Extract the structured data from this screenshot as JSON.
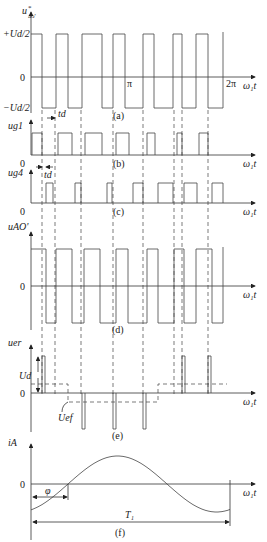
{
  "diagram": {
    "axis_x": 31,
    "axis_end_x": 255,
    "x_axis_label": "ω₁t",
    "dashed_lines_x": [
      42,
      55,
      81,
      113,
      143,
      174,
      182,
      208
    ],
    "panels": [
      {
        "id": "a",
        "caption": "(a)",
        "y_label": "u*ₐₒ'",
        "y_ticks": [
          "+Ud/2",
          "0",
          "−Ud/2"
        ],
        "x_ticks": [
          "π",
          "2π"
        ],
        "zero_y": 77,
        "high_y": 34,
        "low_y": 108,
        "high_intervals": [
          [
            31,
            42
          ],
          [
            56,
            68
          ],
          [
            82,
            102
          ],
          [
            113,
            125
          ],
          [
            143,
            154
          ],
          [
            173,
            182
          ],
          [
            196,
            208
          ]
        ],
        "end_x": 223
      },
      {
        "id": "b",
        "caption": "(b)",
        "y_label": "ug1",
        "base_y": 155,
        "top_y": 133,
        "pulses": [
          [
            32,
            42
          ],
          [
            58,
            72
          ],
          [
            85,
            102
          ],
          [
            116,
            129
          ],
          [
            147,
            155
          ],
          [
            177,
            182
          ],
          [
            199,
            208
          ]
        ],
        "dead_time_label": "td"
      },
      {
        "id": "c",
        "caption": "(c)",
        "y_label": "ug4",
        "base_y": 203,
        "top_y": 183,
        "pulses": [
          [
            46,
            53
          ],
          [
            75,
            81
          ],
          [
            107,
            112
          ],
          [
            133,
            143
          ],
          [
            158,
            173
          ],
          [
            184,
            197
          ],
          [
            212,
            223
          ]
        ],
        "dead_time_label": "td"
      },
      {
        "id": "d",
        "caption": "(d)",
        "y_label": "uAO'",
        "zero_y": 286,
        "high_y": 249,
        "low_y": 323,
        "high_intervals": [
          [
            31,
            46
          ],
          [
            56,
            72
          ],
          [
            84,
            100
          ],
          [
            116,
            128
          ],
          [
            147,
            158
          ],
          [
            174,
            184
          ],
          [
            196,
            212
          ]
        ],
        "end_x": 223
      },
      {
        "id": "e",
        "caption": "(e)",
        "y_label": "uer",
        "zero_y": 393,
        "pos_top_y": 356,
        "neg_bottom_y": 429,
        "pos_pulses": [
          [
            42,
            45
          ],
          [
            182,
            185
          ],
          [
            208,
            211
          ]
        ],
        "neg_pulses": [
          [
            82,
            85
          ],
          [
            113,
            116
          ],
          [
            143,
            146
          ]
        ],
        "ud_label": "Ud",
        "uef_label": "Uef",
        "dashed_level_pos_y": 384,
        "dashed_level_neg_y": 402,
        "dashed_steps": [
          [
            31,
            68,
            "pos"
          ],
          [
            68,
            158,
            "neg"
          ],
          [
            158,
            227,
            "pos"
          ]
        ]
      },
      {
        "id": "f",
        "caption": "(f)",
        "y_label": "iA",
        "zero_y": 484,
        "peak_y": 456,
        "start_y": 511,
        "zero_cross_1": 68,
        "zero_cross_2": 167,
        "end_x": 230,
        "phi_label": "φ",
        "period_label": "T₁",
        "phi_arrow_y": 497,
        "period_arrow_y": 522
      }
    ]
  }
}
